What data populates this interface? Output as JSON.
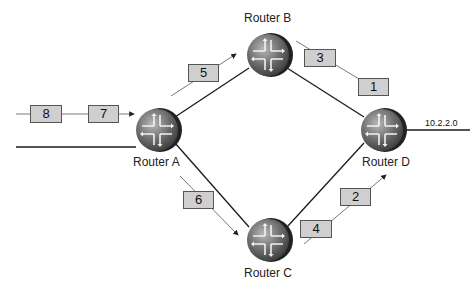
{
  "routers": [
    {
      "id": "A",
      "label": "Router A",
      "cx": 157,
      "cy": 130
    },
    {
      "id": "B",
      "label": "Router B",
      "cx": 268,
      "cy": 55
    },
    {
      "id": "C",
      "label": "Router C",
      "cx": 268,
      "cy": 240
    },
    {
      "id": "D",
      "label": "Router D",
      "cx": 382,
      "cy": 130
    }
  ],
  "network": {
    "label": "10.2.2.0"
  },
  "packets": [
    {
      "num": "8",
      "x": 30,
      "y": 105
    },
    {
      "num": "7",
      "x": 88,
      "y": 105
    },
    {
      "num": "5",
      "x": 188,
      "y": 64
    },
    {
      "num": "3",
      "x": 304,
      "y": 49
    },
    {
      "num": "1",
      "x": 358,
      "y": 78
    },
    {
      "num": "6",
      "x": 183,
      "y": 191
    },
    {
      "num": "4",
      "x": 300,
      "y": 220
    },
    {
      "num": "2",
      "x": 340,
      "y": 188
    }
  ],
  "colors": {
    "packet_fill": "#cfcfcf",
    "router_body": "#6b6b6b",
    "link": "#1a1a1a"
  }
}
